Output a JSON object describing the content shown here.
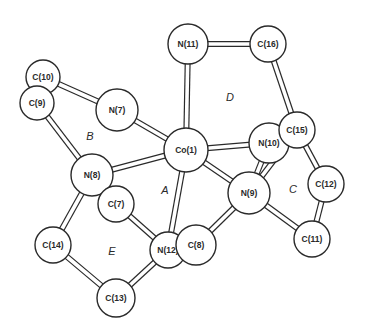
{
  "diagram": {
    "type": "molecular-structure",
    "colors": {
      "stroke": "#2a2a2a",
      "fill": "#ffffff"
    },
    "atoms": [
      {
        "id": "C10",
        "label": "C(10)",
        "x": 43,
        "y": 77,
        "r": 17
      },
      {
        "id": "C9",
        "label": "C(9)",
        "x": 37,
        "y": 103,
        "r": 17
      },
      {
        "id": "N11",
        "label": "N(11)",
        "x": 188,
        "y": 44,
        "r": 20
      },
      {
        "id": "C16",
        "label": "C(16)",
        "x": 268,
        "y": 44,
        "r": 18
      },
      {
        "id": "N7",
        "label": "N(7)",
        "x": 117,
        "y": 110,
        "r": 21
      },
      {
        "id": "Co1",
        "label": "Co(1)",
        "x": 186,
        "y": 150,
        "r": 22
      },
      {
        "id": "N10",
        "label": "N(10)",
        "x": 269,
        "y": 143,
        "r": 20
      },
      {
        "id": "C15",
        "label": "C(15)",
        "x": 297,
        "y": 130,
        "r": 18
      },
      {
        "id": "N8",
        "label": "N(8)",
        "x": 92,
        "y": 175,
        "r": 21
      },
      {
        "id": "C7",
        "label": "C(7)",
        "x": 116,
        "y": 204,
        "r": 18
      },
      {
        "id": "N9",
        "label": "N(9)",
        "x": 249,
        "y": 193,
        "r": 21
      },
      {
        "id": "C12",
        "label": "C(12)",
        "x": 326,
        "y": 184,
        "r": 18
      },
      {
        "id": "C14",
        "label": "C(14)",
        "x": 53,
        "y": 245,
        "r": 18
      },
      {
        "id": "N12",
        "label": "N(12)",
        "x": 168,
        "y": 250,
        "r": 18
      },
      {
        "id": "C8",
        "label": "C(8)",
        "x": 196,
        "y": 245,
        "r": 20
      },
      {
        "id": "C11",
        "label": "C(11)",
        "x": 312,
        "y": 239,
        "r": 18
      },
      {
        "id": "C13",
        "label": "C(13)",
        "x": 116,
        "y": 298,
        "r": 19
      }
    ],
    "bonds": [
      [
        "N11",
        "C16"
      ],
      [
        "N11",
        "Co1"
      ],
      [
        "C16",
        "C15"
      ],
      [
        "C10",
        "N7"
      ],
      [
        "C9",
        "N8"
      ],
      [
        "N7",
        "Co1"
      ],
      [
        "Co1",
        "N10"
      ],
      [
        "Co1",
        "N8"
      ],
      [
        "Co1",
        "N9"
      ],
      [
        "Co1",
        "N12"
      ],
      [
        "N10",
        "N9"
      ],
      [
        "C15",
        "N9"
      ],
      [
        "C15",
        "C12"
      ],
      [
        "C12",
        "C11"
      ],
      [
        "N9",
        "C11"
      ],
      [
        "N8",
        "C7"
      ],
      [
        "N8",
        "C14"
      ],
      [
        "C7",
        "N12"
      ],
      [
        "N9",
        "C8"
      ],
      [
        "C14",
        "C13"
      ],
      [
        "C13",
        "N12"
      ]
    ],
    "ring_labels": [
      {
        "label": "A",
        "x": 165,
        "y": 190
      },
      {
        "label": "B",
        "x": 90,
        "y": 136
      },
      {
        "label": "C",
        "x": 293,
        "y": 189
      },
      {
        "label": "D",
        "x": 230,
        "y": 97
      },
      {
        "label": "E",
        "x": 112,
        "y": 251
      }
    ]
  }
}
